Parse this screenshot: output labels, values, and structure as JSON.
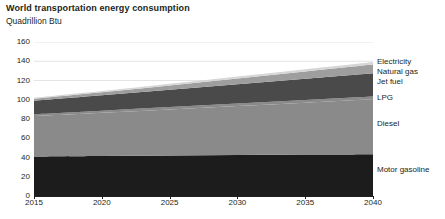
{
  "chart_data": {
    "type": "area",
    "stacked": true,
    "title": "World transportation energy consumption",
    "subtitle": "Quadrillion Btu",
    "xlabel": "",
    "ylabel": "Quadrillion Btu",
    "xlim": [
      2015,
      2040
    ],
    "ylim": [
      0,
      160
    ],
    "ytick_step": 20,
    "xtick_step": 5,
    "grid": true,
    "grid_axis": "y",
    "legend_position": "right-inline",
    "x": [
      2015,
      2020,
      2025,
      2030,
      2035,
      2040
    ],
    "yticks": [
      0,
      20,
      40,
      60,
      80,
      100,
      120,
      140,
      160
    ],
    "xticks": [
      2015,
      2020,
      2025,
      2030,
      2035,
      2040
    ],
    "ytick_labels": [
      "0",
      "20",
      "40",
      "60",
      "80",
      "100",
      "120",
      "140",
      "160"
    ],
    "xtick_labels": [
      "2015",
      "2020",
      "2025",
      "2030",
      "2035",
      "2040"
    ],
    "series": [
      {
        "name": "Motor gasoline",
        "color": "#1c1c1c",
        "values": [
          41,
          41.5,
          42,
          42.5,
          43,
          43.5
        ]
      },
      {
        "name": "Diesel",
        "color": "#8a8a8a",
        "values": [
          42,
          45,
          48,
          51,
          54,
          57
        ]
      },
      {
        "name": "LPG",
        "color": "#8a8a8a",
        "values": [
          2,
          2.2,
          2.4,
          2.6,
          2.8,
          3
        ]
      },
      {
        "name": "Jet fuel",
        "color": "#4a4a4a",
        "values": [
          14,
          16,
          18,
          20,
          22,
          24
        ]
      },
      {
        "name": "Natural gas",
        "color": "#9e9e9e",
        "values": [
          2,
          3,
          4.5,
          6,
          7.5,
          9
        ]
      },
      {
        "name": "Electricity",
        "color": "#d6d6d6",
        "values": [
          1,
          1.3,
          1.6,
          2,
          2.4,
          2.8
        ]
      }
    ],
    "totals": [
      102,
      109,
      116.5,
      124.1,
      131.7,
      139.3
    ]
  },
  "legend": {
    "items": [
      {
        "label": "Electricity",
        "y_px": 20
      },
      {
        "label": "Natural gas",
        "y_px": 30
      },
      {
        "label": "Jet fuel",
        "y_px": 40
      },
      {
        "label": "LPG",
        "y_px": 56
      },
      {
        "label": "Diesel",
        "y_px": 82
      },
      {
        "label": "Motor gasoline",
        "y_px": 128
      }
    ]
  },
  "colors": {
    "background": "#ffffff",
    "text": "#231f20",
    "axis": "#231f20",
    "gridline": "#d9d9d9"
  }
}
